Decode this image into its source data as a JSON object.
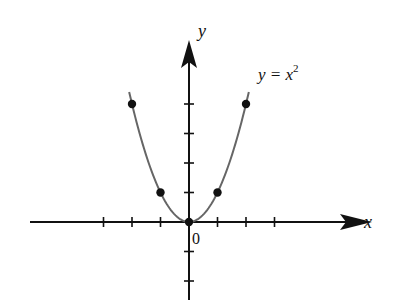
{
  "chart_data": {
    "type": "line",
    "title": "",
    "xlabel": "x",
    "ylabel": "y",
    "origin_label": "0",
    "curve_label": "y = x",
    "curve_label_exponent": "2",
    "function": "y = x^2",
    "series": [
      {
        "name": "y = x^2",
        "x": [
          -2.1,
          -2,
          -1,
          0,
          1,
          2,
          2.1
        ],
        "values": [
          4.41,
          4,
          1,
          0,
          1,
          4,
          4.41
        ]
      }
    ],
    "marked_points": [
      {
        "x": -2,
        "y": 4
      },
      {
        "x": -1,
        "y": 1
      },
      {
        "x": 0,
        "y": 0
      },
      {
        "x": 1,
        "y": 1
      },
      {
        "x": 2,
        "y": 4
      }
    ],
    "x_ticks": [
      -3,
      -2,
      -1,
      1,
      2,
      3
    ],
    "y_ticks": [
      -2,
      -1,
      1,
      2,
      3,
      4
    ],
    "xlim": [
      -5.6,
      6.2
    ],
    "ylim": [
      -2.8,
      5.6
    ],
    "grid": false,
    "colors": {
      "axis": "#111111",
      "curve": "#666666",
      "points": "#111111"
    }
  }
}
